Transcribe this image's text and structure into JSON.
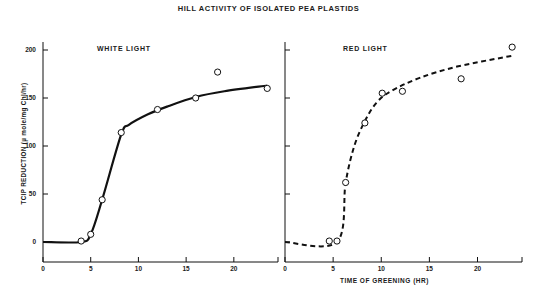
{
  "figure": {
    "title": "HILL ACTIVITY OF ISOLATED PEA PLASTIDS",
    "bottom_caption": ""
  },
  "axes": {
    "y_title": "TCIP REDUCTION (µ mole/mg Chl/hr)",
    "x_title": "TIME OF GREENING (HR)",
    "y_ticks": [
      "0",
      "50",
      "100",
      "150",
      "200"
    ],
    "x_ticks_left": [
      "0",
      "5",
      "10",
      "15",
      "20"
    ],
    "x_ticks_right": [
      "0",
      "5",
      "10",
      "15",
      "20"
    ]
  },
  "panels": {
    "left_label": "WHITE LIGHT",
    "right_label": "RED LIGHT"
  },
  "colors": {
    "ink": "#111111",
    "background": "#ffffff"
  },
  "chart_data": [
    {
      "type": "scatter",
      "title": "WHITE LIGHT",
      "xlabel": "TIME OF GREENING (HR)",
      "ylabel": "TCIP REDUCTION (µ mole/mg Chl/hr)",
      "xlim": [
        0,
        24
      ],
      "ylim": [
        -20,
        215
      ],
      "xticks": [
        0,
        5,
        10,
        15,
        20
      ],
      "yticks": [
        0,
        50,
        100,
        150,
        200
      ],
      "grid": false,
      "legend": "none",
      "marker": "open-circle",
      "line_style": "solid",
      "points": [
        {
          "x": 4.0,
          "y": 1
        },
        {
          "x": 5.0,
          "y": 8
        },
        {
          "x": 6.2,
          "y": 44
        },
        {
          "x": 8.2,
          "y": 114
        },
        {
          "x": 12.0,
          "y": 138
        },
        {
          "x": 16.0,
          "y": 150
        },
        {
          "x": 18.3,
          "y": 177
        },
        {
          "x": 23.5,
          "y": 160
        }
      ],
      "fit_curve": [
        {
          "x": 0.0,
          "y": 0
        },
        {
          "x": 4.0,
          "y": 0
        },
        {
          "x": 5.0,
          "y": 8
        },
        {
          "x": 6.2,
          "y": 44
        },
        {
          "x": 8.2,
          "y": 112
        },
        {
          "x": 9.0,
          "y": 122
        },
        {
          "x": 11.0,
          "y": 133
        },
        {
          "x": 13.0,
          "y": 141
        },
        {
          "x": 16.0,
          "y": 151
        },
        {
          "x": 19.0,
          "y": 157
        },
        {
          "x": 23.5,
          "y": 163
        }
      ]
    },
    {
      "type": "scatter",
      "title": "RED LIGHT",
      "xlabel": "TIME OF GREENING (HR)",
      "ylabel": "TCIP REDUCTION (µ mole/mg Chl/hr)",
      "xlim": [
        0,
        24
      ],
      "ylim": [
        -20,
        215
      ],
      "xticks": [
        0,
        5,
        10,
        15,
        20
      ],
      "yticks": [
        0,
        50,
        100,
        150,
        200
      ],
      "grid": false,
      "legend": "none",
      "marker": "open-circle",
      "line_style": "dashed",
      "points": [
        {
          "x": 4.6,
          "y": 1
        },
        {
          "x": 5.4,
          "y": 1
        },
        {
          "x": 6.3,
          "y": 62
        },
        {
          "x": 8.3,
          "y": 124
        },
        {
          "x": 10.1,
          "y": 155
        },
        {
          "x": 12.2,
          "y": 157
        },
        {
          "x": 18.3,
          "y": 170
        },
        {
          "x": 23.6,
          "y": 203
        }
      ],
      "fit_curve": [
        {
          "x": 0.0,
          "y": 0
        },
        {
          "x": 5.4,
          "y": 0
        },
        {
          "x": 6.3,
          "y": 62
        },
        {
          "x": 7.2,
          "y": 100
        },
        {
          "x": 8.3,
          "y": 126
        },
        {
          "x": 9.5,
          "y": 145
        },
        {
          "x": 11.0,
          "y": 157
        },
        {
          "x": 14.0,
          "y": 171
        },
        {
          "x": 18.0,
          "y": 183
        },
        {
          "x": 23.6,
          "y": 194
        }
      ]
    }
  ]
}
